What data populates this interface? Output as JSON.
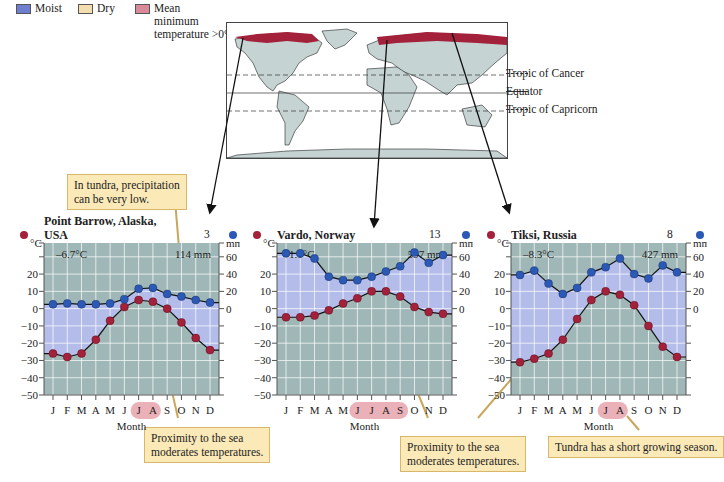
{
  "legend": {
    "items": [
      {
        "label": "Moist",
        "color": "#6f7fd0"
      },
      {
        "label": "Dry",
        "color": "#f4deb0"
      },
      {
        "label": "Mean minimum temperature >0°C",
        "lines": [
          "Mean",
          "minimum",
          "temperature >0°C"
        ],
        "color": "#d98a9a"
      }
    ]
  },
  "map": {
    "labels": {
      "tropic_cancer": "Tropic of Cancer",
      "equator": "Equator",
      "tropic_capricorn": "Tropic of Capricorn"
    },
    "tundra_color": "#a3213a",
    "land_color": "#c5d3d3"
  },
  "callouts": {
    "precip_low": [
      "In tundra, precipitation",
      "can be very low."
    ],
    "sea_1": [
      "Proximity to the sea",
      "moderates temperatures."
    ],
    "sea_2": [
      "Proximity to the sea",
      "moderates temperatures."
    ],
    "growing": "Tundra has a short growing season."
  },
  "colors": {
    "plot_bg": "#9fb7b6",
    "moist_fill": "#b4bdea",
    "temp_dot": "#a3213a",
    "precip_dot": "#2c59b5",
    "highlight": "#e7a3ab"
  },
  "chart_data": [
    {
      "type": "line",
      "title": "Point Barrow, Alaska, USA",
      "elevation": "3 m",
      "mean_temp": "–6.7°C",
      "annual_precip": "114 mm",
      "xlabel": "Month",
      "ylabel_left": "°C",
      "ylabel_right": "mm",
      "categories": [
        "J",
        "F",
        "M",
        "A",
        "M",
        "J",
        "J",
        "A",
        "S",
        "O",
        "N",
        "D"
      ],
      "highlight_months": [
        "J",
        "A"
      ],
      "highlight_indices": [
        6,
        7
      ],
      "y_ticks_left": [
        20,
        10,
        0,
        -10,
        -20,
        -30,
        -40,
        -50
      ],
      "y_ticks_right": [
        60,
        40,
        20,
        0
      ],
      "ylim_temp": [
        -50,
        38
      ],
      "series": [
        {
          "name": "Temperature (°C)",
          "values": [
            -26,
            -28,
            -26,
            -18,
            -7,
            1,
            5,
            4,
            0,
            -8,
            -17,
            -24
          ]
        },
        {
          "name": "Precipitation (mm)",
          "values": [
            5,
            6,
            5,
            5,
            6,
            11,
            23,
            24,
            17,
            14,
            10,
            7
          ]
        }
      ]
    },
    {
      "type": "line",
      "title": "Vardo, Norway",
      "elevation": "13 m",
      "mean_temp": "1.1°C",
      "annual_precip": "597 mm",
      "xlabel": "Month",
      "ylabel_left": "°C",
      "ylabel_right": "mm",
      "categories": [
        "J",
        "F",
        "M",
        "A",
        "M",
        "J",
        "J",
        "A",
        "S",
        "O",
        "N",
        "D"
      ],
      "highlight_months": [
        "J",
        "J",
        "A",
        "S"
      ],
      "highlight_indices": [
        5,
        6,
        7,
        8
      ],
      "y_ticks_left": [
        20,
        10,
        0,
        -10,
        -20,
        -30,
        -40,
        -50
      ],
      "y_ticks_right": [
        60,
        40,
        20,
        0
      ],
      "ylim_temp": [
        -50,
        38
      ],
      "series": [
        {
          "name": "Temperature (°C)",
          "values": [
            -5,
            -5,
            -4,
            -1,
            3,
            6,
            10,
            10,
            7,
            1,
            -2,
            -3
          ]
        },
        {
          "name": "Precipitation (mm)",
          "values": [
            64,
            64,
            58,
            37,
            33,
            33,
            37,
            43,
            49,
            65,
            53,
            62
          ]
        }
      ]
    },
    {
      "type": "line",
      "title": "Tiksi, Russia",
      "elevation": "8 m",
      "mean_temp": "–8.3°C",
      "annual_precip": "427 mm",
      "xlabel": "Month",
      "ylabel_left": "°C",
      "ylabel_right": "mm",
      "categories": [
        "J",
        "F",
        "M",
        "A",
        "M",
        "J",
        "J",
        "A",
        "S",
        "O",
        "N",
        "D"
      ],
      "highlight_months": [
        "J",
        "A"
      ],
      "highlight_indices": [
        6,
        7
      ],
      "y_ticks_left": [
        20,
        10,
        0,
        -10,
        -20,
        -30,
        -40,
        -50
      ],
      "y_ticks_right": [
        60,
        40,
        20,
        0
      ],
      "ylim_temp": [
        -50,
        38
      ],
      "series": [
        {
          "name": "Temperature (°C)",
          "values": [
            -31,
            -29,
            -26,
            -18,
            -6,
            5,
            10,
            8,
            2,
            -10,
            -22,
            -28
          ]
        },
        {
          "name": "Precipitation (mm)",
          "values": [
            39,
            44,
            29,
            17,
            24,
            42,
            48,
            58,
            40,
            35,
            50,
            42
          ]
        }
      ]
    }
  ]
}
